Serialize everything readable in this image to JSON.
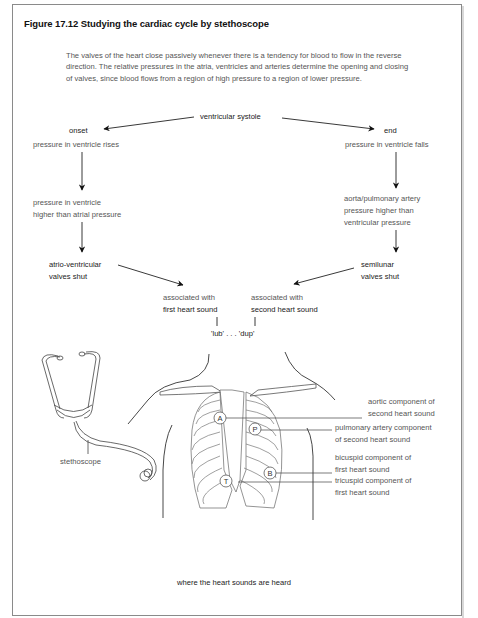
{
  "figure": {
    "title": "Figure 17.12  Studying the cardiac cycle by stethoscope",
    "intro": "The valves of the heart close passively whenever there is a tendency for blood to flow in the reverse direction. The relative pressures in the atria, ventricles and arteries determine the opening and closing of valves, since blood flows from a region of high pressure to a region of lower pressure."
  },
  "flow": {
    "root": "ventricular systole",
    "left": {
      "heading": "onset",
      "step1": "pressure in ventricle rises",
      "step2_line1": "pressure in ventricle",
      "step2_line2": "higher than atrial pressure",
      "result_line1": "atrio-ventricular",
      "result_line2": "valves shut",
      "assoc_line1": "associated with",
      "assoc_line2": "first heart sound"
    },
    "right": {
      "heading": "end",
      "step1": "pressure in ventricle falls",
      "step2_line1": "aorta/pulmonary artery",
      "step2_line2": "pressure higher than",
      "step2_line3": "ventricular pressure",
      "result_line1": "semilunar",
      "result_line2": "valves shut",
      "assoc_line1": "associated with",
      "assoc_line2": "second heart sound"
    },
    "sounds": "'lub' . . . 'dup'"
  },
  "illustration": {
    "stethoscope_label": "stethoscope",
    "markers": [
      "A",
      "P",
      "B",
      "T"
    ],
    "labels": {
      "aortic_1": "aortic component of",
      "aortic_2": "second heart sound",
      "pulmonary_1": "pulmonary artery component",
      "pulmonary_2": "of second heart sound",
      "bicuspid_1": "bicuspid component of",
      "bicuspid_2": "first heart sound",
      "tricuspid_1": "tricuspid component of",
      "tricuspid_2": "first heart sound"
    },
    "caption": "where the heart sounds are heard"
  }
}
